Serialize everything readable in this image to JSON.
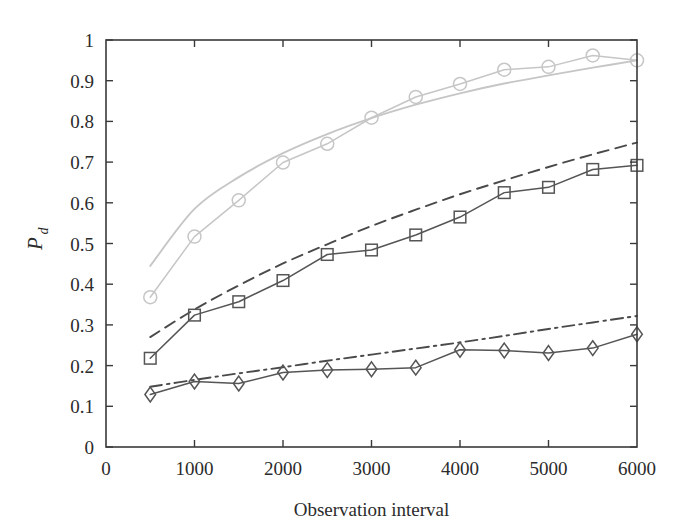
{
  "chart_data": {
    "type": "line",
    "title": "",
    "xlabel": "Observation interval",
    "ylabel": "P_d",
    "ylabel_base": "P",
    "ylabel_sub": "d",
    "xlim": [
      0,
      6000
    ],
    "ylim": [
      0,
      1
    ],
    "xticks": [
      0,
      1000,
      2000,
      3000,
      4000,
      5000,
      6000
    ],
    "xticklabels": [
      "0",
      "1000",
      "2000",
      "3000",
      "4000",
      "5000",
      "6000"
    ],
    "yticks": [
      0,
      0.1,
      0.2,
      0.3,
      0.4,
      0.5,
      0.6,
      0.7,
      0.8,
      0.9,
      1
    ],
    "yticklabels": [
      "0",
      "0.1",
      "0.2",
      "0.3",
      "0.4",
      "0.5",
      "0.6",
      "0.7",
      "0.8",
      "0.9",
      "1"
    ],
    "grid": false,
    "legend": "none",
    "x": [
      500,
      1000,
      1500,
      2000,
      2500,
      3000,
      3500,
      4000,
      4500,
      5000,
      5500,
      6000
    ],
    "series": [
      {
        "name": "theory-upper",
        "style": "solid",
        "marker": "none",
        "color": "#c6c6c6",
        "x": [
          500,
          1000,
          1500,
          2000,
          2500,
          3000,
          3500,
          4000,
          4500,
          5000,
          5500,
          6000
        ],
        "values": [
          0.445,
          0.585,
          0.663,
          0.722,
          0.769,
          0.808,
          0.841,
          0.869,
          0.893,
          0.913,
          0.932,
          0.95
        ]
      },
      {
        "name": "simulation-circles",
        "style": "solid",
        "marker": "circle",
        "color": "#c6c6c6",
        "x": [
          500,
          1000,
          1500,
          2000,
          2500,
          3000,
          3500,
          4000,
          4500,
          5000,
          5500,
          6000
        ],
        "values": [
          0.368,
          0.517,
          0.606,
          0.699,
          0.745,
          0.809,
          0.86,
          0.892,
          0.927,
          0.934,
          0.962,
          0.95
        ]
      },
      {
        "name": "theory-middle",
        "style": "dashed",
        "marker": "none",
        "color": "#4a4a4a",
        "x": [
          500,
          1000,
          1500,
          2000,
          2500,
          3000,
          3500,
          4000,
          4500,
          5000,
          5500,
          6000
        ],
        "values": [
          0.27,
          0.338,
          0.397,
          0.451,
          0.498,
          0.543,
          0.583,
          0.621,
          0.655,
          0.688,
          0.719,
          0.748
        ]
      },
      {
        "name": "simulation-squares",
        "style": "solid",
        "marker": "square",
        "color": "#555555",
        "x": [
          500,
          1000,
          1500,
          2000,
          2500,
          3000,
          3500,
          4000,
          4500,
          5000,
          5500,
          6000
        ],
        "values": [
          0.218,
          0.324,
          0.357,
          0.409,
          0.473,
          0.484,
          0.521,
          0.565,
          0.625,
          0.638,
          0.682,
          0.692
        ]
      },
      {
        "name": "theory-lower",
        "style": "dashdot",
        "marker": "none",
        "color": "#4a4a4a",
        "x": [
          500,
          1000,
          1500,
          2000,
          2500,
          3000,
          3500,
          4000,
          4500,
          5000,
          5500,
          6000
        ],
        "values": [
          0.148,
          0.165,
          0.181,
          0.196,
          0.212,
          0.227,
          0.242,
          0.257,
          0.273,
          0.29,
          0.306,
          0.322
        ]
      },
      {
        "name": "simulation-diamonds",
        "style": "solid",
        "marker": "diamond",
        "color": "#555555",
        "x": [
          500,
          1000,
          1500,
          2000,
          2500,
          3000,
          3500,
          4000,
          4500,
          5000,
          5500,
          6000
        ],
        "values": [
          0.129,
          0.161,
          0.156,
          0.183,
          0.189,
          0.191,
          0.195,
          0.239,
          0.237,
          0.231,
          0.243,
          0.277
        ]
      }
    ]
  },
  "colors": {
    "light_series": "#c6c6c6",
    "dark_series": "#555555",
    "axis": "#3a3a3a",
    "text": "#2b2b2b",
    "background": "#ffffff"
  }
}
